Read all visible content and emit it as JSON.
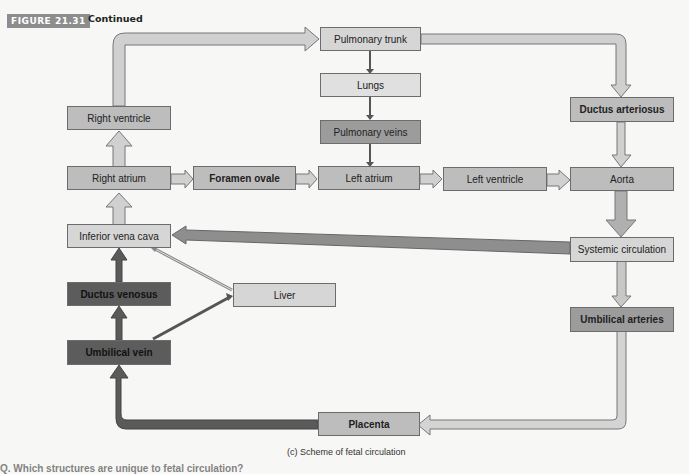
{
  "figure": {
    "label": "FIGURE 21.31",
    "continued": "Continued",
    "caption": "(c) Scheme of fetal circulation",
    "question_fragment": "Q. Which structures are unique to fetal circulation?"
  },
  "nodes": {
    "pulmonary_trunk": "Pulmonary trunk",
    "lungs": "Lungs",
    "pulmonary_veins": "Pulmonary veins",
    "right_ventricle": "Right ventricle",
    "right_atrium": "Right atrium",
    "foramen_ovale": "Foramen ovale",
    "left_atrium": "Left atrium",
    "left_ventricle": "Left ventricle",
    "aorta": "Aorta",
    "ductus_arteriosus": "Ductus arteriosus",
    "inferior_vena_cava": "Inferior vena cava",
    "systemic_circulation": "Systemic circulation",
    "ductus_venosus": "Ductus venosus",
    "liver": "Liver",
    "umbilical_vein": "Umbilical vein",
    "umbilical_arteries": "Umbilical arteries",
    "placenta": "Placenta"
  },
  "edges": [
    [
      "Right ventricle",
      "Pulmonary trunk"
    ],
    [
      "Pulmonary trunk",
      "Lungs"
    ],
    [
      "Lungs",
      "Pulmonary veins"
    ],
    [
      "Pulmonary veins",
      "Left atrium"
    ],
    [
      "Pulmonary trunk",
      "Ductus arteriosus"
    ],
    [
      "Ductus arteriosus",
      "Aorta"
    ],
    [
      "Right atrium",
      "Right ventricle"
    ],
    [
      "Right atrium",
      "Foramen ovale"
    ],
    [
      "Foramen ovale",
      "Left atrium"
    ],
    [
      "Left atrium",
      "Left ventricle"
    ],
    [
      "Left ventricle",
      "Aorta"
    ],
    [
      "Aorta",
      "Systemic circulation"
    ],
    [
      "Systemic circulation",
      "Inferior vena cava"
    ],
    [
      "Systemic circulation",
      "Umbilical arteries"
    ],
    [
      "Umbilical arteries",
      "Placenta"
    ],
    [
      "Placenta",
      "Umbilical vein"
    ],
    [
      "Umbilical vein",
      "Ductus venosus"
    ],
    [
      "Umbilical vein",
      "Liver"
    ],
    [
      "Ductus venosus",
      "Inferior vena cava"
    ],
    [
      "Liver",
      "Inferior vena cava"
    ],
    [
      "Inferior vena cava",
      "Right atrium"
    ]
  ],
  "colors": {
    "light": "#d6d6d6",
    "mid": "#bdbdbd",
    "dark": "#9c9c9c",
    "very_dark": "#5c5c5c"
  }
}
